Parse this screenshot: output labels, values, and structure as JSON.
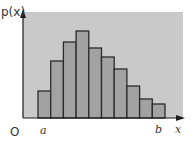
{
  "chart_data": {
    "type": "bar",
    "title": "",
    "ylabel": "p(x)",
    "xlabel": "x",
    "origin_label": "O",
    "x_markers": [
      {
        "label": "a",
        "position": "start of first bar"
      },
      {
        "label": "b",
        "position": "end of last bar"
      }
    ],
    "categories": [
      "1",
      "2",
      "3",
      "4",
      "5",
      "6",
      "7",
      "8",
      "9",
      "10"
    ],
    "values": [
      27,
      57,
      76,
      87,
      70,
      61,
      49,
      32,
      19,
      14
    ],
    "value_units": "relative bar height (px, unlabeled axis)",
    "ylim": [
      0,
      106
    ],
    "grid": false,
    "legend": null,
    "colors": {
      "panel": "#c9c9c9",
      "bar_fill": "#a2a2a2",
      "bar_stroke": "#2b2b2b",
      "axis": "#1a1a1a"
    }
  },
  "labels": {
    "y_axis": "p(x)",
    "x_axis": "x",
    "origin": "O",
    "a": "a",
    "b": "b"
  }
}
